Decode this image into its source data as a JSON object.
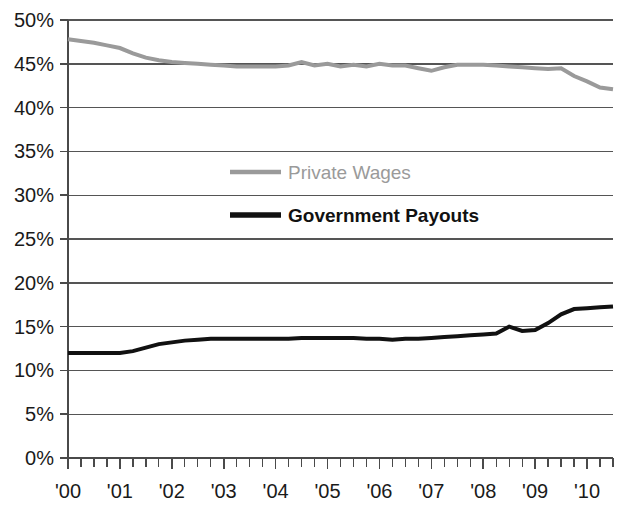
{
  "chart_data": {
    "type": "line",
    "title": "",
    "subtitle": "",
    "xlabel": "",
    "ylabel": "",
    "xlim": [
      2000.0,
      2010.5
    ],
    "ylim": [
      0,
      50
    ],
    "ytick_step": 5,
    "grid": true,
    "grid_axis": "y",
    "legend_position": "inside-upper-center",
    "x_tick_labels": [
      "'00",
      "'01",
      "'02",
      "'03",
      "'04",
      "'05",
      "'06",
      "'07",
      "'08",
      "'09",
      "'10"
    ],
    "x_tick_values": [
      2000,
      2001,
      2002,
      2003,
      2004,
      2005,
      2006,
      2007,
      2008,
      2009,
      2010
    ],
    "x_minor_per_major": 4,
    "y_tick_labels": [
      "0%",
      "5%",
      "10%",
      "15%",
      "20%",
      "25%",
      "30%",
      "35%",
      "40%",
      "45%",
      "50%"
    ],
    "y_tick_values": [
      0,
      5,
      10,
      15,
      20,
      25,
      30,
      35,
      40,
      45,
      50
    ],
    "colors": {
      "private_wages": "#9a9a9a",
      "government_payouts": "#111111",
      "axis": "#4a4a4a",
      "grid": "#555555",
      "background": "#ffffff",
      "text": "#1a1a1a"
    },
    "x": [
      2000.0,
      2000.25,
      2000.5,
      2000.75,
      2001.0,
      2001.25,
      2001.5,
      2001.75,
      2002.0,
      2002.25,
      2002.5,
      2002.75,
      2003.0,
      2003.25,
      2003.5,
      2003.75,
      2004.0,
      2004.25,
      2004.5,
      2004.75,
      2005.0,
      2005.25,
      2005.5,
      2005.75,
      2006.0,
      2006.25,
      2006.5,
      2006.75,
      2007.0,
      2007.25,
      2007.5,
      2007.75,
      2008.0,
      2008.25,
      2008.5,
      2008.75,
      2009.0,
      2009.25,
      2009.5,
      2009.75,
      2010.0,
      2010.25,
      2010.5
    ],
    "series": [
      {
        "name": "Private Wages",
        "color": "#9a9a9a",
        "width": 4,
        "values": [
          47.8,
          47.6,
          47.4,
          47.1,
          46.8,
          46.2,
          45.7,
          45.4,
          45.2,
          45.1,
          45.0,
          44.9,
          44.8,
          44.7,
          44.7,
          44.7,
          44.7,
          44.8,
          45.2,
          44.8,
          45.0,
          44.7,
          44.9,
          44.7,
          45.0,
          44.8,
          44.8,
          44.5,
          44.2,
          44.6,
          44.9,
          44.9,
          44.9,
          44.8,
          44.7,
          44.6,
          44.5,
          44.4,
          44.5,
          43.6,
          43.0,
          42.3,
          42.1
        ]
      },
      {
        "name": "Government Payouts",
        "color": "#111111",
        "width": 4,
        "values": [
          12.0,
          12.0,
          12.0,
          12.0,
          12.0,
          12.2,
          12.6,
          13.0,
          13.2,
          13.4,
          13.5,
          13.6,
          13.6,
          13.6,
          13.6,
          13.6,
          13.6,
          13.6,
          13.7,
          13.7,
          13.7,
          13.7,
          13.7,
          13.6,
          13.6,
          13.5,
          13.6,
          13.6,
          13.7,
          13.8,
          13.9,
          14.0,
          14.1,
          14.2,
          15.0,
          14.5,
          14.6,
          15.4,
          16.4,
          17.0,
          17.1,
          17.2,
          17.3
        ]
      }
    ]
  },
  "legend": {
    "items": [
      {
        "label": "Private Wages",
        "color": "#9a9a9a",
        "bold": false
      },
      {
        "label": "Government Payouts",
        "color": "#111111",
        "bold": true
      }
    ]
  }
}
